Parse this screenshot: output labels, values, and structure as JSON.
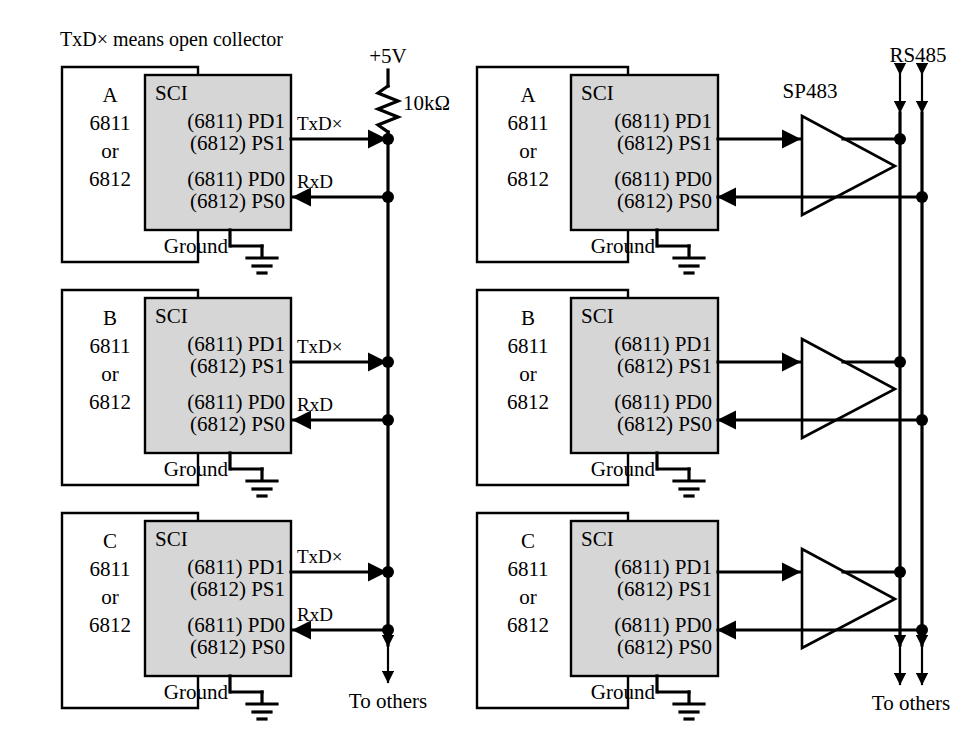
{
  "figure": {
    "caption": "TxD× means open collector",
    "title_left": "",
    "title_right": ""
  },
  "left_network": {
    "supply_label": "+5V",
    "resistor_label": "10kΩ",
    "bus_bottom_label": "To others",
    "tx_signal_label": "TxD×",
    "rx_signal_label": "RxD",
    "nodes": [
      {
        "id": "A",
        "name_label": "A",
        "mcu_line1": "6811",
        "mcu_line2": "or",
        "mcu_line3": "6812",
        "sci_label": "SCI",
        "port_tx_line1": "(6811) PD1",
        "port_tx_line2": "(6812) PS1",
        "port_rx_line1": "(6811) PD0",
        "port_rx_line2": "(6812) PS0",
        "ground_label": "Ground"
      },
      {
        "id": "B",
        "name_label": "B",
        "mcu_line1": "6811",
        "mcu_line2": "or",
        "mcu_line3": "6812",
        "sci_label": "SCI",
        "port_tx_line1": "(6811) PD1",
        "port_tx_line2": "(6812) PS1",
        "port_rx_line1": "(6811) PD0",
        "port_rx_line2": "(6812) PS0",
        "ground_label": "Ground"
      },
      {
        "id": "C",
        "name_label": "C",
        "mcu_line1": "6811",
        "mcu_line2": "or",
        "mcu_line3": "6812",
        "sci_label": "SCI",
        "port_tx_line1": "(6811) PD1",
        "port_tx_line2": "(6812) PS1",
        "port_rx_line1": "(6811) PD0",
        "port_rx_line2": "(6812) PS0",
        "ground_label": "Ground"
      }
    ]
  },
  "right_network": {
    "bus_label": "RS485",
    "driver_label": "SP483",
    "bus_bottom_label": "To others",
    "nodes": [
      {
        "id": "A",
        "name_label": "A",
        "mcu_line1": "6811",
        "mcu_line2": "or",
        "mcu_line3": "6812",
        "sci_label": "SCI",
        "port_tx_line1": "(6811) PD1",
        "port_tx_line2": "(6812) PS1",
        "port_rx_line1": "(6811) PD0",
        "port_rx_line2": "(6812) PS0",
        "ground_label": "Ground",
        "driver_label": "SP483"
      },
      {
        "id": "B",
        "name_label": "B",
        "mcu_line1": "6811",
        "mcu_line2": "or",
        "mcu_line3": "6812",
        "sci_label": "SCI",
        "port_tx_line1": "(6811) PD1",
        "port_tx_line2": "(6812) PS1",
        "port_rx_line1": "(6811) PD0",
        "port_rx_line2": "(6812) PS0",
        "ground_label": "Ground",
        "driver_label": ""
      },
      {
        "id": "C",
        "name_label": "C",
        "mcu_line1": "6811",
        "mcu_line2": "or",
        "mcu_line3": "6812",
        "sci_label": "SCI",
        "port_tx_line1": "(6811) PD1",
        "port_tx_line2": "(6812) PS1",
        "port_rx_line1": "(6811) PD0",
        "port_rx_line2": "(6812) PS0",
        "ground_label": "Ground",
        "driver_label": ""
      }
    ]
  },
  "colors": {
    "ink": "#000000",
    "sci_fill": "#d6d6d6",
    "paper": "#ffffff"
  }
}
